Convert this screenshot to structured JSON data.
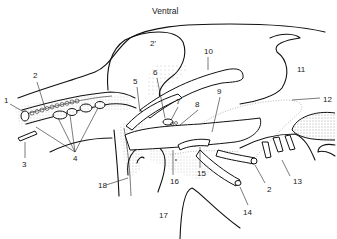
{
  "diagram": {
    "title": "Ventral",
    "type": "anatomical line drawing",
    "labels": [
      {
        "id": "1",
        "text": "1",
        "x": 4,
        "y": 103
      },
      {
        "id": "2a",
        "text": "2",
        "x": 33,
        "y": 78
      },
      {
        "id": "2prime",
        "text": "2'",
        "x": 150,
        "y": 46
      },
      {
        "id": "3",
        "text": "3",
        "x": 22,
        "y": 167
      },
      {
        "id": "4",
        "text": "4",
        "x": 73,
        "y": 161
      },
      {
        "id": "5",
        "text": "5",
        "x": 133,
        "y": 84
      },
      {
        "id": "6",
        "text": "6",
        "x": 153,
        "y": 75
      },
      {
        "id": "7",
        "text": "7",
        "x": 176,
        "y": 104
      },
      {
        "id": "8",
        "text": "8",
        "x": 195,
        "y": 107
      },
      {
        "id": "9",
        "text": "9",
        "x": 217,
        "y": 94
      },
      {
        "id": "10",
        "text": "10",
        "x": 204,
        "y": 54
      },
      {
        "id": "11",
        "text": "11",
        "x": 297,
        "y": 72
      },
      {
        "id": "12",
        "text": "12",
        "x": 323,
        "y": 102
      },
      {
        "id": "13",
        "text": "13",
        "x": 293,
        "y": 184
      },
      {
        "id": "14",
        "text": "14",
        "x": 243,
        "y": 215
      },
      {
        "id": "15",
        "text": "15",
        "x": 197,
        "y": 176
      },
      {
        "id": "16",
        "text": "16",
        "x": 170,
        "y": 184
      },
      {
        "id": "17",
        "text": "17",
        "x": 159,
        "y": 218
      },
      {
        "id": "18",
        "text": "18",
        "x": 98,
        "y": 188
      },
      {
        "id": "2b",
        "text": "2",
        "x": 267,
        "y": 192
      }
    ]
  }
}
